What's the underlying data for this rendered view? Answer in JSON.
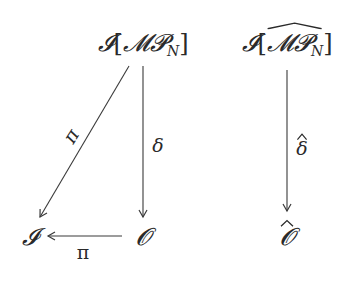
{
  "diagram": {
    "type": "commutative-diagram",
    "nodes": {
      "top_left": {
        "prefix": "𝓘",
        "open": "[",
        "core": "𝓜𝓟",
        "sub": "N",
        "close": "]",
        "latex": "\\mathcal{I}[\\mathcal{MP}_N]"
      },
      "top_right": {
        "prefix": "𝓘",
        "open": "[",
        "core": "𝓜𝓟",
        "sub": "N",
        "close": "]",
        "latex": "\\mathcal{I}[\\widehat{\\mathcal{MP}_N}]"
      },
      "bottom_left": {
        "text": "𝓘",
        "latex": "\\mathcal{I}"
      },
      "bottom_mid": {
        "text": "𝓞",
        "latex": "\\mathcal{O}"
      },
      "bottom_right": {
        "text": "𝓞",
        "hat": "^",
        "latex": "\\widehat{\\mathcal{O}}"
      }
    },
    "edges": [
      {
        "from": "top_left",
        "to": "bottom_left",
        "label": "π"
      },
      {
        "from": "top_left",
        "to": "bottom_mid",
        "label": "δ"
      },
      {
        "from": "bottom_mid",
        "to": "bottom_left",
        "label": "π"
      },
      {
        "from": "top_right",
        "to": "bottom_right",
        "label": "δ",
        "label_hat": true
      }
    ],
    "labels": {
      "diag_pi": "π",
      "delta": "δ",
      "bottom_pi": "π",
      "delta_hat": "δ"
    },
    "colors": {
      "line": "#3a3a3a",
      "text": "#2a2a2a",
      "background": "#ffffff"
    }
  }
}
